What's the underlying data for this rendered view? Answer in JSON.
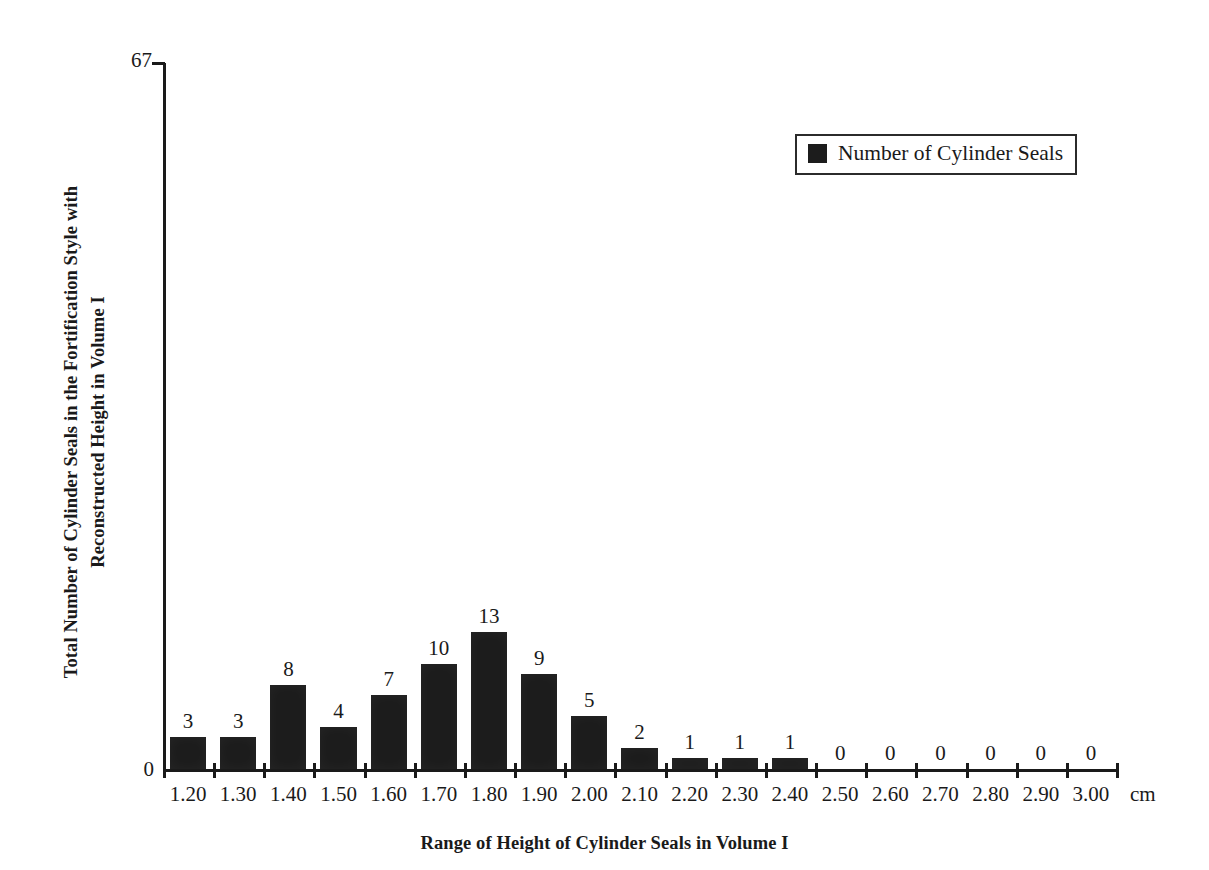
{
  "chart_data": {
    "type": "bar",
    "title": "",
    "xlabel": "Range of Height of Cylinder Seals in Volume I",
    "ylabel": "Total Number of Cylinder Seals in the Fortification Style with Reconstructed Height in Volume I",
    "x_unit": "cm",
    "categories": [
      "1.20",
      "1.30",
      "1.40",
      "1.50",
      "1.60",
      "1.70",
      "1.80",
      "1.90",
      "2.00",
      "2.10",
      "2.20",
      "2.30",
      "2.40",
      "2.50",
      "2.60",
      "2.70",
      "2.80",
      "2.90",
      "3.00"
    ],
    "values": [
      3,
      3,
      8,
      4,
      7,
      10,
      13,
      9,
      5,
      2,
      1,
      1,
      1,
      0,
      0,
      0,
      0,
      0,
      0
    ],
    "value_labels": [
      "3",
      "3",
      "8",
      "4",
      "7",
      "10",
      "13",
      "9",
      "5",
      "2",
      "1",
      "1",
      "1",
      "0",
      "0",
      "0",
      "0",
      "0",
      "0"
    ],
    "ylim": [
      0,
      67
    ],
    "y_tick_labels": [
      "0",
      "67"
    ],
    "y_axis_max_label": "67",
    "y_axis_min_label": "0",
    "grid": false,
    "legend": {
      "position": "top-right",
      "entries": [
        {
          "label": "Number of Cylinder Seals",
          "color": "#1c1c1c",
          "marker": "square"
        }
      ]
    },
    "bar_color": "#1c1c1c",
    "axis_color": "#1a1a1a"
  },
  "legend": {
    "entry_label": "Number of Cylinder Seals"
  },
  "axes": {
    "y_title": "Total Number of Cylinder Seals in the Fortification Style with Reconstructed Height in Volume I",
    "y_title_line1": "Total Number of Cylinder Seals in the Fortification Style with",
    "y_title_line2": "Reconstructed Height in Volume I",
    "x_title": "Range of Height of Cylinder Seals in Volume I",
    "y_max": "67",
    "y_zero": "0",
    "x_unit": "cm"
  }
}
